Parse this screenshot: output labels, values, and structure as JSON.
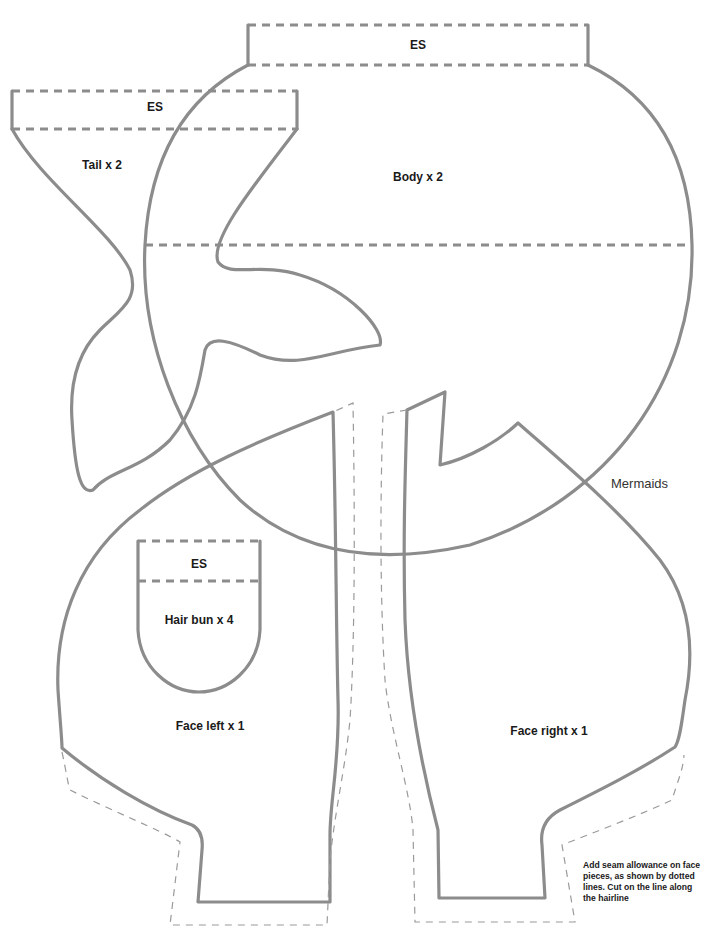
{
  "title": "Mermaids",
  "pieces": {
    "body": {
      "label": "Body x 2",
      "extension": "ES"
    },
    "tail": {
      "label": "Tail x 2",
      "extension": "ES"
    },
    "hair_bun": {
      "label": "Hair bun x 4",
      "extension": "ES"
    },
    "face_left": {
      "label": "Face left x 1"
    },
    "face_right": {
      "label": "Face right x 1"
    }
  },
  "note": "Add seam allowance on face pieces, as shown by dotted lines. Cut on the line along the hairline",
  "colors": {
    "line": "#8c8c8c",
    "hairline": "#9a9a9a",
    "text": "#1a1a1a"
  }
}
